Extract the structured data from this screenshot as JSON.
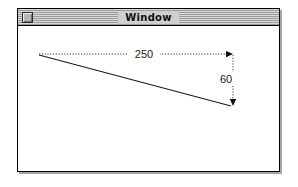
{
  "window": {
    "title": "Window",
    "close_box": "close-box",
    "titlebar_stripe_light": "#d8d8d8",
    "titlebar_stripe_dark": "#9c9c9c",
    "frame_color": "#000000",
    "content_bg": "#ffffff"
  },
  "diagram": {
    "type": "line-with-dimensions",
    "line_color": "#1a1a1a",
    "guide_style": "dotted",
    "origin_label": "",
    "measurements": [
      {
        "name": "horizontal-run",
        "value": "250",
        "orientation": "horizontal",
        "arrow": "right"
      },
      {
        "name": "vertical-drop",
        "value": "60",
        "orientation": "vertical",
        "arrow": "down"
      }
    ],
    "geometry": {
      "start_x": 21,
      "start_y": 29,
      "end_x": 213,
      "end_y": 80,
      "guide_top_y": 28,
      "guide_right_x": 215
    }
  }
}
